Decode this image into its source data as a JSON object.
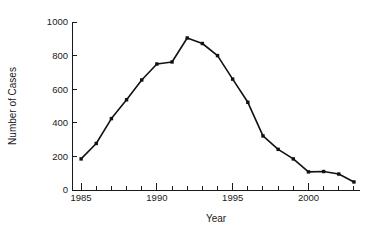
{
  "chart_data": {
    "type": "line",
    "title": "",
    "xlabel": "Year",
    "ylabel": "Number of Cases",
    "xlim": [
      1984.4,
      2003.4
    ],
    "ylim": [
      0,
      1000
    ],
    "xticks": [
      1985,
      1990,
      1995,
      2000
    ],
    "xtick_labels": [
      "1985",
      "1990",
      "1995",
      "2000"
    ],
    "x_minor_ticks": [
      1986,
      1987,
      1988,
      1989,
      1991,
      1992,
      1993,
      1994,
      1996,
      1997,
      1998,
      1999,
      2001,
      2002,
      2003
    ],
    "yticks": [
      0,
      200,
      400,
      600,
      800,
      1000
    ],
    "ytick_labels": [
      "0",
      "200",
      "400",
      "600",
      "800",
      "1000"
    ],
    "grid": false,
    "legend": null,
    "marker": "filled-square",
    "line_color": "#111111",
    "marker_color": "#111111",
    "x": [
      1985,
      1986,
      1987,
      1988,
      1989,
      1990,
      1991,
      1992,
      1993,
      1994,
      1995,
      1996,
      1997,
      1998,
      1999,
      2000,
      2001,
      2002,
      2003
    ],
    "values": [
      185,
      277,
      425,
      537,
      655,
      750,
      762,
      905,
      872,
      800,
      660,
      522,
      322,
      242,
      185,
      108,
      110,
      95,
      48
    ],
    "series": [
      {
        "name": "Number of Cases",
        "values": [
          185,
          277,
          425,
          537,
          655,
          750,
          762,
          905,
          872,
          800,
          660,
          522,
          322,
          242,
          185,
          108,
          110,
          95,
          48
        ]
      }
    ]
  },
  "figure": {
    "background_color": "#ffffff",
    "axis_color": "#1a1a1a"
  }
}
